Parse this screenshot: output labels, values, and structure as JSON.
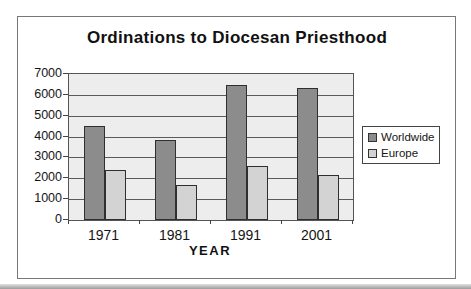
{
  "chart_data": {
    "type": "bar",
    "title": "Ordinations to Diocesan Priesthood",
    "xlabel": "YEAR",
    "ylabel": "",
    "categories": [
      "1971",
      "1981",
      "1991",
      "2001"
    ],
    "series": [
      {
        "name": "Worldwide",
        "color": "#8c8c8c",
        "values": [
          4500,
          3850,
          6450,
          6350
        ]
      },
      {
        "name": "Europe",
        "color": "#d3d3d3",
        "values": [
          2400,
          1700,
          2600,
          2150
        ]
      }
    ],
    "ylim": [
      0,
      7000
    ],
    "yticks": [
      0,
      1000,
      2000,
      3000,
      4000,
      5000,
      6000,
      7000
    ],
    "grid": true,
    "legend_position": "right",
    "colors": {
      "plot_background": "#ededed",
      "gridline": "#5a5a5a",
      "bar_border": "#2f2f2f",
      "frame_border": "#777777",
      "text": "#1a1a1a"
    }
  }
}
